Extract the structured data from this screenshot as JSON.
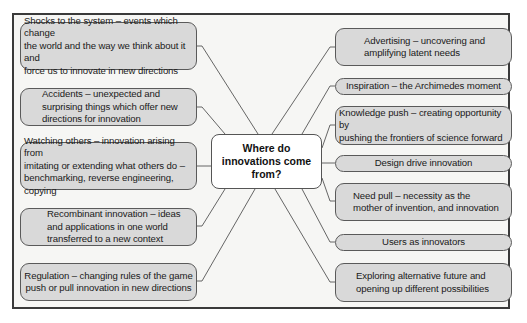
{
  "diagram": {
    "title": "Where do innovations come from?",
    "center": {
      "line1": "Where do",
      "line2": "innovations come",
      "line3": "from?"
    },
    "left_sources": [
      {
        "id": "shocks",
        "lines": [
          "Shocks to the system – events which change",
          "the world and the way we think about it and",
          "force us to innovate in new directions"
        ]
      },
      {
        "id": "accidents",
        "lines": [
          "Accidents – unexpected and",
          "surprising things which offer new",
          "directions for innovation"
        ]
      },
      {
        "id": "watching-others",
        "lines": [
          "Watching others – innovation arising from",
          "imitating or extending what others do –",
          "benchmarking, reverse engineering, copying"
        ]
      },
      {
        "id": "recombinant",
        "lines": [
          "Recombinant innovation – ideas",
          "and applications in one world",
          "transferred to a new context"
        ]
      },
      {
        "id": "regulation",
        "lines": [
          "Regulation – changing rules of the game",
          "push or pull innovation in new directions"
        ]
      }
    ],
    "right_sources": [
      {
        "id": "advertising",
        "lines": [
          "Advertising – uncovering and",
          "amplifying latent needs"
        ]
      },
      {
        "id": "inspiration",
        "lines": [
          "Inspiration – the Archimedes moment"
        ]
      },
      {
        "id": "knowledge-push",
        "lines": [
          "Knowledge push – creating opportunity by",
          "pushing the frontiers of science forward"
        ]
      },
      {
        "id": "design-drive",
        "lines": [
          "Design drive innovation"
        ]
      },
      {
        "id": "need-pull",
        "lines": [
          "Need pull – necessity as the",
          "mother of invention, and innovation"
        ]
      },
      {
        "id": "users",
        "lines": [
          "Users as innovators"
        ]
      },
      {
        "id": "exploring",
        "lines": [
          "Exploring alternative future and",
          "opening up different possibilities"
        ]
      }
    ],
    "colors": {
      "box_fill": "#d9d9d9",
      "box_border": "#5a5a5a",
      "center_fill": "#ffffff",
      "frame_border": "#3a3a3a",
      "connector": "#555555",
      "background": "#f6f6f4"
    }
  }
}
